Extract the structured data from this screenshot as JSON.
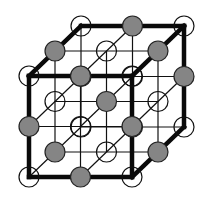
{
  "diagram": {
    "title": "",
    "type": "crystal-lattice",
    "structure": "rock-salt (NaCl) face-centered cubic unit cell",
    "grid_points_per_axis": 3,
    "origin": [
      29,
      76
    ],
    "axis_x": [
      51.5,
      0
    ],
    "axis_y": [
      0,
      50.5
    ],
    "axis_depth": [
      26,
      -25
    ],
    "ion_radius": 10,
    "colors": {
      "background": "#ffffff",
      "line": "#111111",
      "outline": "#0a0a0a",
      "filled_ion": "#858585",
      "open_ion_stroke": "#111111"
    },
    "ion_types": [
      {
        "name": "open-ion",
        "description": "open circle (hollow)",
        "parity": "even"
      },
      {
        "name": "filled-ion",
        "description": "gray filled sphere",
        "parity": "odd"
      }
    ],
    "thick_outline_edges": [
      [
        [
          0,
          0,
          0
        ],
        [
          2,
          0,
          0
        ]
      ],
      [
        [
          2,
          0,
          0
        ],
        [
          2,
          2,
          0
        ]
      ],
      [
        [
          2,
          2,
          0
        ],
        [
          0,
          2,
          0
        ]
      ],
      [
        [
          0,
          2,
          0
        ],
        [
          0,
          0,
          0
        ]
      ],
      [
        [
          0,
          0,
          0
        ],
        [
          0,
          0,
          2
        ]
      ],
      [
        [
          0,
          0,
          2
        ],
        [
          2,
          0,
          2
        ]
      ],
      [
        [
          2,
          0,
          2
        ],
        [
          2,
          0,
          0
        ]
      ],
      [
        [
          2,
          0,
          2
        ],
        [
          2,
          2,
          2
        ]
      ],
      [
        [
          2,
          2,
          2
        ],
        [
          2,
          2,
          0
        ]
      ]
    ]
  }
}
